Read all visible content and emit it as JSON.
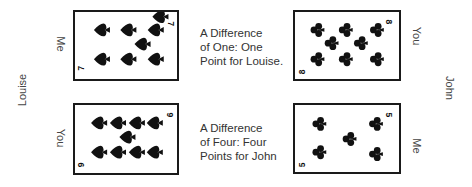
{
  "players": {
    "left": "Louise",
    "right": "John"
  },
  "rounds": [
    {
      "left_card": {
        "rank": "7",
        "suit": "spades",
        "owner_label": "Me"
      },
      "right_card": {
        "rank": "8",
        "suit": "clubs",
        "owner_label": "You"
      },
      "caption": [
        "A Difference",
        "of One: One",
        "Point for Louise."
      ]
    },
    {
      "left_card": {
        "rank": "9",
        "suit": "spades",
        "owner_label": "You"
      },
      "right_card": {
        "rank": "5",
        "suit": "clubs",
        "owner_label": "Me"
      },
      "caption": [
        "A Difference",
        "of Four: Four",
        "Points for John"
      ]
    }
  ],
  "colors": {
    "ink": "#1a1a1a",
    "text": "#333333",
    "background": "#ffffff"
  }
}
